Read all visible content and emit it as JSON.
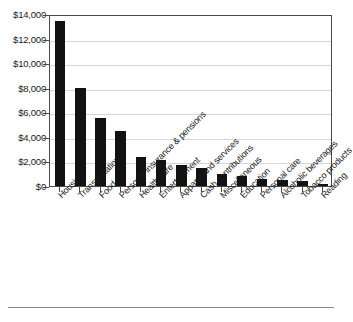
{
  "chart_data": {
    "type": "bar",
    "title": "",
    "xlabel": "",
    "ylabel": "",
    "ylim": [
      0,
      14000
    ],
    "grid": true,
    "legend": null,
    "categories": [
      "Housing",
      "Transportation",
      "Food",
      "Personal insurance & pensions",
      "Health care",
      "Entertainment",
      "Apparel and services",
      "Cash contributions",
      "Miscellaneous",
      "Education",
      "Personal care",
      "Alcoholic beverages",
      "Tobacco products",
      "Reading"
    ],
    "values": [
      13400,
      8000,
      5500,
      4500,
      2350,
      2100,
      1750,
      1450,
      950,
      800,
      600,
      450,
      400,
      150
    ],
    "y_ticks": [
      0,
      2000,
      4000,
      6000,
      8000,
      10000,
      12000,
      14000
    ],
    "y_tick_labels": [
      "$0",
      "$2,000",
      "$4,000",
      "$6,000",
      "$8,000",
      "$10,000",
      "$12,000",
      "$14,000"
    ],
    "bar_color": "#121212",
    "grid_color": "#d7d7d7",
    "axis_color": "#4a4a4a"
  }
}
